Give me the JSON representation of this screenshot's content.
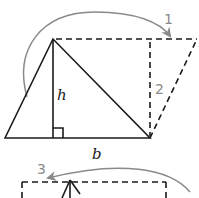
{
  "diagram": {
    "labels": {
      "height": "h",
      "base": "b",
      "step1": "1",
      "step2": "2",
      "step3": "3"
    },
    "colors": {
      "lines": "#1a1a1a",
      "arrows": "#8a8a8a"
    },
    "shapes": {
      "triangle": {
        "vertices": [
          [
            5,
            138
          ],
          [
            53,
            39
          ],
          [
            150,
            138
          ]
        ]
      },
      "altitude": {
        "from": [
          53,
          39
        ],
        "to": [
          53,
          138
        ]
      },
      "parallelogram_dashed": {
        "vertices": [
          [
            53,
            39
          ],
          [
            197,
            39
          ],
          [
            150,
            138
          ]
        ]
      },
      "dashed_height": {
        "from": [
          150,
          39
        ],
        "to": [
          150,
          138
        ]
      }
    }
  }
}
